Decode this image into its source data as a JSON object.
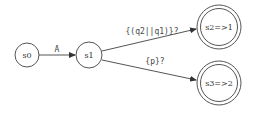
{
  "diagram": {
    "type": "state-machine",
    "nodes": [
      {
        "id": "s0",
        "label": "s0",
        "accepting": false,
        "cx": 27,
        "cy": 55,
        "r": 12
      },
      {
        "id": "s1",
        "label": "s1",
        "accepting": false,
        "cx": 89,
        "cy": 55,
        "r": 13
      },
      {
        "id": "s2",
        "label": "s2=>1",
        "accepting": true,
        "cx": 219,
        "cy": 27,
        "r": 22
      },
      {
        "id": "s3",
        "label": "s3=>2",
        "accepting": true,
        "cx": 219,
        "cy": 83,
        "r": 22
      }
    ],
    "edges": [
      {
        "from": "s0",
        "to": "s1",
        "label": "A"
      },
      {
        "from": "s1",
        "to": "s2",
        "label": "{(q2||q1)}?"
      },
      {
        "from": "s1",
        "to": "s3",
        "label": "{p}?"
      }
    ]
  },
  "colors": {
    "stroke": "#555555",
    "text": "#333333",
    "background": "#ffffff"
  }
}
